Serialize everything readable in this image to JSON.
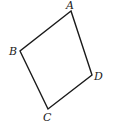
{
  "diagram": {
    "type": "quadrilateral",
    "stroke_color": "#1a1a1a",
    "vertices": {
      "A": {
        "label": "A",
        "x": 71,
        "y": 11
      },
      "B": {
        "label": "B",
        "x": 20,
        "y": 51
      },
      "C": {
        "label": "C",
        "x": 48,
        "y": 109
      },
      "D": {
        "label": "D",
        "x": 92,
        "y": 75
      }
    },
    "labels": {
      "A": "A",
      "B": "B",
      "C": "C",
      "D": "D"
    }
  }
}
